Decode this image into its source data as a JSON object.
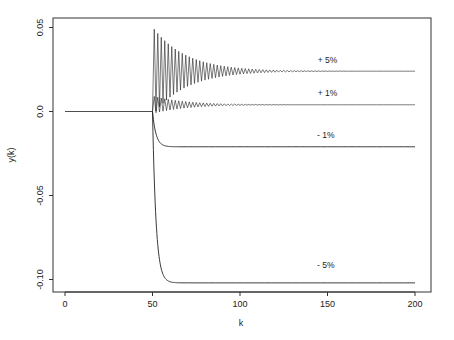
{
  "chart_data": {
    "type": "line",
    "title": "",
    "xlabel": "k",
    "ylabel": "y(k)",
    "xlim": [
      -5,
      210
    ],
    "ylim": [
      -0.105,
      0.058
    ],
    "xticks": [
      0,
      50,
      100,
      150,
      200
    ],
    "xtick_labels": [
      "0",
      "50",
      "100",
      "150",
      "200"
    ],
    "yticks": [
      0.05,
      0.0,
      -0.05,
      -0.1
    ],
    "ytick_labels": [
      "0.05",
      "0.0",
      "-0.05",
      "-0.10"
    ],
    "grid": false,
    "legend": "none (inline labels)",
    "step_at_k": 50,
    "initial_value": 0.0,
    "series": [
      {
        "name": "+ 5%",
        "label": "+ 5%",
        "steady_value": 0.024,
        "behavior": "oscillating",
        "peak": 0.049,
        "decay_k": 110
      },
      {
        "name": "+ 1%",
        "label": "+ 1%",
        "steady_value": 0.004,
        "behavior": "oscillating",
        "peak": 0.009,
        "decay_k": 110
      },
      {
        "name": "- 1%",
        "label": "- 1%",
        "steady_value": -0.021,
        "behavior": "monotonic",
        "settle_k": 58
      },
      {
        "name": "- 5%",
        "label": "- 5%",
        "steady_value": -0.102,
        "behavior": "monotonic",
        "settle_k": 58
      }
    ],
    "annotations": [
      {
        "text": "+ 5%",
        "x": 150,
        "y": 0.029
      },
      {
        "text": "+ 1%",
        "x": 150,
        "y": 0.009
      },
      {
        "text": "- 1%",
        "x": 149,
        "y": -0.016
      },
      {
        "text": "- 5%",
        "x": 149,
        "y": -0.093
      }
    ]
  }
}
